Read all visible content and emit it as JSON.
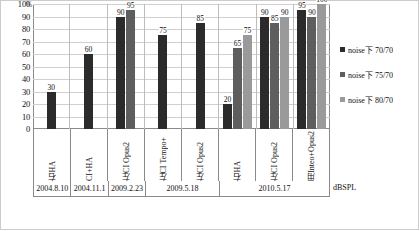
{
  "chart_data": {
    "type": "bar",
    "title": "",
    "xlabel": "",
    "ylabel": "%",
    "unit_caption": "dBSPL",
    "ylim": [
      0,
      100
    ],
    "yticks": [
      0,
      10,
      20,
      30,
      40,
      50,
      60,
      70,
      80,
      90,
      100
    ],
    "grid": true,
    "legend_position": "right",
    "categories": [
      "右HA",
      "CI+HA",
      "左CI Opus2",
      "左CI Tempo+",
      "左CI Opus2",
      "右HA",
      "左CI Opus2",
      "用Inteo+Opus2"
    ],
    "group_dates": [
      {
        "label": "2004.8.10",
        "span": 1
      },
      {
        "label": "2004.11.1",
        "span": 1
      },
      {
        "label": "2009.2.23",
        "span": 1
      },
      {
        "label": "2009.5.18",
        "span": 2
      },
      {
        "label": "2010.5.17",
        "span": 3
      }
    ],
    "series": [
      {
        "name": "noise下 70/70",
        "color": "#2b2b2b",
        "values": [
          30,
          60,
          90,
          75,
          85,
          20,
          90,
          95
        ]
      },
      {
        "name": "noise下 75/70",
        "color": "#5e5e5e",
        "values": [
          null,
          null,
          95,
          null,
          null,
          65,
          85,
          90
        ]
      },
      {
        "name": "noise下 80/70",
        "color": "#9a9a9a",
        "values": [
          null,
          null,
          null,
          null,
          null,
          75,
          90,
          100
        ]
      }
    ]
  },
  "legend": {
    "items": [
      {
        "label": "noise下  70/70"
      },
      {
        "label": "noise下  75/70"
      },
      {
        "label": "noise下  80/70"
      }
    ]
  },
  "axis": {
    "y_top_label": "%",
    "unit": "dBSPL"
  }
}
